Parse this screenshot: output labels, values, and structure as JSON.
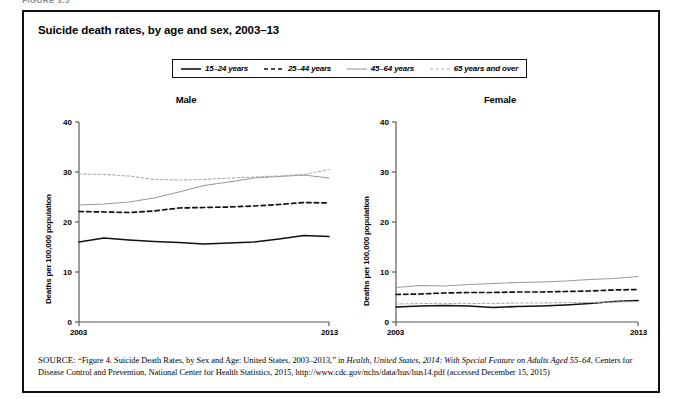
{
  "page": {
    "header_sliver": "FIGURE 3.5"
  },
  "figure": {
    "title": "Suicide death rates, by age and sex, 2003–13"
  },
  "legend": {
    "items": [
      {
        "label": "15–24 years",
        "style": "solid-black",
        "color": "#111111",
        "icon": "line-swatch-solid-icon"
      },
      {
        "label": "25–44 years",
        "style": "dashed-black",
        "color": "#111111",
        "icon": "line-swatch-dashed-icon"
      },
      {
        "label": "45–64 years",
        "style": "solid-gray",
        "color": "#9a9a9a",
        "icon": "line-swatch-solid-gray-icon"
      },
      {
        "label": "65 years and over",
        "style": "dotted-gray",
        "color": "#adadad",
        "icon": "line-swatch-dotted-icon"
      }
    ]
  },
  "axis": {
    "y_label": "Deaths per 100,000 population",
    "y_ticks": [
      "0",
      "10",
      "20",
      "30",
      "40"
    ],
    "x_ticks": [
      "2003",
      "2013"
    ]
  },
  "panels": [
    {
      "title": "Male"
    },
    {
      "title": "Female"
    }
  ],
  "source": {
    "prefix": "SOURCE:",
    "part1": " “Figure 4. Suicide Death Rates, by Sex and Age: United States, 2003–2013,” in ",
    "italic1": "Health, United States, 2014: With Special Feature on Adults Aged 55–64",
    "part2": ", Centers for Disease Control and Prevention, National Center for Health Statistics, 2015, http://www.cdc.gov/nchs/data/hus/hus14.pdf (accessed December 15, 2015)"
  },
  "chart_data": [
    {
      "type": "line",
      "title": "Male",
      "xlabel": "",
      "ylabel": "Deaths per 100,000 population",
      "x": [
        2003,
        2004,
        2005,
        2006,
        2007,
        2008,
        2009,
        2010,
        2011,
        2012,
        2013
      ],
      "xlim": [
        2003,
        2013
      ],
      "ylim": [
        0,
        40
      ],
      "yticks": [
        0,
        10,
        20,
        30,
        40
      ],
      "xticks": [
        2003,
        2013
      ],
      "grid": false,
      "legend_position": "top-center-shared",
      "series": [
        {
          "name": "15–24 years",
          "color": "#111111",
          "style": "solid",
          "width": 1.6,
          "values": [
            16.0,
            16.8,
            16.4,
            16.1,
            15.9,
            15.6,
            15.8,
            16.0,
            16.6,
            17.3,
            17.1
          ]
        },
        {
          "name": "25–44 years",
          "color": "#111111",
          "style": "dashed",
          "width": 1.7,
          "values": [
            22.1,
            22.0,
            21.9,
            22.2,
            22.8,
            22.9,
            23.0,
            23.2,
            23.5,
            23.9,
            23.8
          ]
        },
        {
          "name": "45–64 years",
          "color": "#9a9a9a",
          "style": "solid",
          "width": 1.1,
          "values": [
            23.4,
            23.6,
            24.0,
            24.8,
            26.0,
            27.3,
            28.0,
            28.8,
            29.1,
            29.4,
            28.8
          ]
        },
        {
          "name": "65 years and over",
          "color": "#adadad",
          "style": "dotted",
          "width": 1.1,
          "values": [
            29.6,
            29.5,
            29.2,
            28.5,
            28.4,
            28.5,
            28.8,
            29.0,
            29.2,
            29.5,
            30.5
          ]
        }
      ]
    },
    {
      "type": "line",
      "title": "Female",
      "xlabel": "",
      "ylabel": "Deaths per 100,000 population",
      "x": [
        2003,
        2004,
        2005,
        2006,
        2007,
        2008,
        2009,
        2010,
        2011,
        2012,
        2013
      ],
      "xlim": [
        2003,
        2013
      ],
      "ylim": [
        0,
        40
      ],
      "yticks": [
        0,
        10,
        20,
        30,
        40
      ],
      "xticks": [
        2003,
        2013
      ],
      "grid": false,
      "legend_position": "top-center-shared",
      "series": [
        {
          "name": "15–24 years",
          "color": "#111111",
          "style": "solid",
          "width": 1.6,
          "values": [
            3.0,
            3.2,
            3.3,
            3.2,
            2.9,
            3.1,
            3.2,
            3.4,
            3.7,
            4.1,
            4.3
          ]
        },
        {
          "name": "25–44 years",
          "color": "#111111",
          "style": "dashed",
          "width": 1.7,
          "values": [
            5.5,
            5.6,
            5.8,
            5.9,
            5.9,
            6.0,
            6.0,
            6.1,
            6.2,
            6.4,
            6.5
          ]
        },
        {
          "name": "45–64 years",
          "color": "#9a9a9a",
          "style": "solid",
          "width": 1.1,
          "values": [
            6.9,
            7.3,
            7.2,
            7.5,
            7.7,
            7.9,
            8.0,
            8.2,
            8.5,
            8.7,
            9.1
          ]
        },
        {
          "name": "65 years and over",
          "color": "#adadad",
          "style": "dotted",
          "width": 1.1,
          "values": [
            3.6,
            3.7,
            3.7,
            3.7,
            3.7,
            3.8,
            3.8,
            3.9,
            3.9,
            4.0,
            4.1
          ]
        }
      ]
    }
  ]
}
